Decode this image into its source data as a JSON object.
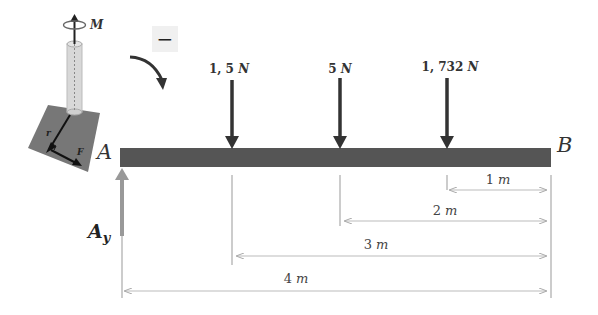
{
  "diagram": {
    "type": "beam-free-body-diagram",
    "beam": {
      "start_label": "A",
      "end_label": "B",
      "color": "#555555"
    },
    "reaction": {
      "label_main": "A",
      "label_sub": "y",
      "color": "#999999"
    },
    "sign_convention": {
      "symbol": "−",
      "rotation": "clockwise"
    },
    "inset": {
      "moment_label": "M",
      "radius_label": "r",
      "force_label": "F"
    },
    "loads": [
      {
        "value": "1, 5",
        "unit": "N",
        "distance_from_B_m": 3
      },
      {
        "value": "5",
        "unit": "N",
        "distance_from_B_m": 2
      },
      {
        "value": "1, 732",
        "unit": "N",
        "distance_from_B_m": 1
      }
    ],
    "dimensions": [
      {
        "value": "1",
        "unit": "m"
      },
      {
        "value": "2",
        "unit": "m"
      },
      {
        "value": "3",
        "unit": "m"
      },
      {
        "value": "4",
        "unit": "m"
      }
    ]
  }
}
